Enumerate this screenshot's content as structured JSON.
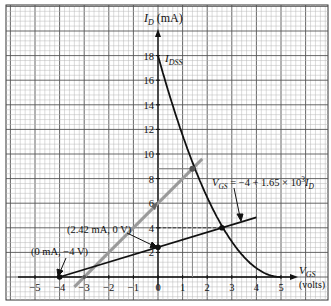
{
  "chart_data": {
    "type": "line",
    "title": "",
    "xlabel": "V_GS (volts)",
    "ylabel": "I_D (mA)",
    "xlim": [
      -5.5,
      6.9
    ],
    "ylim": [
      -1.9,
      22.3
    ],
    "grid": true,
    "x_ticks": [
      -5,
      -4,
      -3,
      -2,
      -1,
      0,
      1,
      2,
      3,
      4,
      5
    ],
    "x_tick_labels": [
      "−5",
      "−4",
      "−3",
      "−2",
      "−1",
      "0",
      "1",
      "2",
      "3",
      "4",
      "5"
    ],
    "y_ticks": [
      2,
      4,
      6,
      8,
      10,
      12,
      14,
      16,
      18
    ],
    "y_tick_labels": [
      "2",
      "4",
      "6",
      "8",
      "10",
      "12",
      "14",
      "16",
      "18"
    ],
    "series": [
      {
        "name": "Transfer curve (Shockley)",
        "style": "solid-black-curve",
        "x": [
          0,
          0.5,
          1.0,
          1.4,
          2.0,
          2.6,
          3.0,
          3.5,
          4.0,
          4.5,
          5.0
        ],
        "y": [
          18,
          14.6,
          11.5,
          9.3,
          6.5,
          4.15,
          2.9,
          1.6,
          0.7,
          0.18,
          0
        ]
      },
      {
        "name": "Load line V_GS = -4 + 1.65 x 10^3 I_D",
        "style": "solid-black-line",
        "x": [
          -4,
          0,
          2.6,
          4
        ],
        "y": [
          0,
          2.42,
          4,
          4.85
        ]
      },
      {
        "name": "Gray construction line",
        "style": "solid-gray-line",
        "x": [
          -3.4,
          -3,
          0,
          1.4,
          1.8
        ],
        "y": [
          -0.8,
          0,
          6,
          8.8,
          9.6
        ]
      }
    ],
    "annotations": [
      {
        "text": "I_DSS",
        "x": 0,
        "y": 18
      },
      {
        "text": "(0 mA, −4 V)",
        "x": -4,
        "y": 0
      },
      {
        "text": "(2.42 mA, 0 V)",
        "x": 0,
        "y": 2.42
      },
      {
        "text": "V_GS = −4 + 1.65 × 10^3 I_D",
        "target": "load line"
      },
      {
        "text": "Q-point",
        "x": 2.6,
        "y": 4
      },
      {
        "text": "gray intersection",
        "x": 1.4,
        "y": 8.8
      }
    ],
    "points": [
      {
        "x": -4,
        "y": 0
      },
      {
        "x": 0,
        "y": 2.42
      },
      {
        "x": 2.6,
        "y": 4
      },
      {
        "x": 1.4,
        "y": 8.8
      }
    ]
  },
  "labels": {
    "y_axis_main": "I",
    "y_axis_sub": "D",
    "y_axis_unit": " (mA)",
    "x_axis_main": "V",
    "x_axis_sub": "GS",
    "x_axis_unit": "(volts)",
    "idss_main": "I",
    "idss_sub": "DSS",
    "point_a": "(0 mA, −4 V)",
    "point_b": "(2.42 mA, 0 V)",
    "eq_v": "V",
    "eq_sub": "GS",
    "eq_body": " = −4 + 1.65 × 10",
    "eq_exp": "3",
    "eq_i": "I",
    "eq_isub": "D"
  }
}
